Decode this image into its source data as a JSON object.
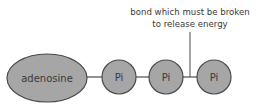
{
  "diagram": {
    "molecule": "ATP",
    "adenosine_label": "adenosine",
    "phosphates": [
      "Pi",
      "Pi",
      "Pi"
    ],
    "annotation_line1": "bond which must be broken",
    "annotation_line2": "to release energy",
    "colors": {
      "fill": "#a6a6a6",
      "stroke": "#4a4a4a",
      "text": "#3a3a3a"
    }
  }
}
